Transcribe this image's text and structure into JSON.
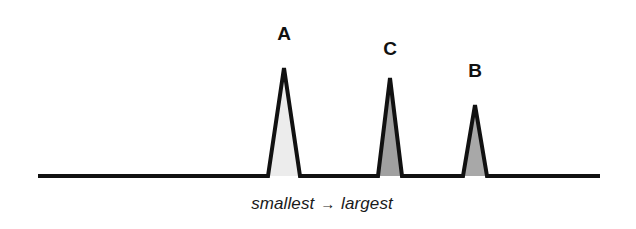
{
  "figure": {
    "background_color": "#ffffff",
    "caption": {
      "left_text": "smallest",
      "arrow": "→",
      "right_text": "largest",
      "full_text": "smallest → largest"
    }
  },
  "axis": {
    "line_color": "#111111",
    "baseline_y": 176,
    "x_start": 38,
    "x_end": 600,
    "thickness": 4
  },
  "chart_data": {
    "type": "line",
    "title": "",
    "xlabel": "smallest → largest",
    "ylabel": "",
    "grid": false,
    "legend": "none",
    "xlim": [
      38,
      600
    ],
    "ylim": [
      0,
      120
    ],
    "annotations": [
      "A",
      "C",
      "B"
    ],
    "peaks": [
      {
        "label": "A",
        "apex_x": 284,
        "base_left_x": 268,
        "base_right_x": 300,
        "apex_y": 68,
        "height": 108,
        "fill_color": "#ececec",
        "stroke_color": "#111111",
        "order": 1
      },
      {
        "label": "C",
        "apex_x": 390,
        "base_left_x": 378,
        "base_right_x": 402,
        "apex_y": 78,
        "height": 98,
        "fill_color": "#a0a0a0",
        "stroke_color": "#111111",
        "order": 2
      },
      {
        "label": "B",
        "apex_x": 475,
        "base_left_x": 463,
        "base_right_x": 487,
        "apex_y": 105,
        "height": 71,
        "fill_color": "#a8a8a8",
        "stroke_color": "#111111",
        "order": 3
      }
    ],
    "categories": [
      "A",
      "C",
      "B"
    ],
    "values": [
      108,
      98,
      71
    ]
  }
}
